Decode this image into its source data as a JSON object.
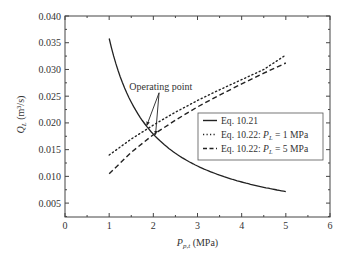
{
  "chart_data": {
    "type": "line",
    "title": "",
    "xlabel": "P_p,t (MPa)",
    "xlabel_main": "P",
    "xlabel_sub": "p,t",
    "xlabel_unit": " (MPa)",
    "ylabel": "Q_L (m3/s)",
    "ylabel_main": "Q",
    "ylabel_sub": "L",
    "ylabel_unit": " (m³/s)",
    "xlim": [
      0,
      6
    ],
    "ylim": [
      0.0024,
      0.04
    ],
    "xticks": [
      "0",
      "1",
      "2",
      "3",
      "4",
      "5",
      "6"
    ],
    "yticks": [
      "0.005",
      "0.010",
      "0.015",
      "0.020",
      "0.025",
      "0.030",
      "0.035",
      "0.040"
    ],
    "grid": false,
    "legend_position": "lower right (inside)",
    "series": [
      {
        "name": "Eq. 10.21",
        "style": "solid",
        "x": [
          1.0,
          1.25,
          1.5,
          1.75,
          2.0,
          2.5,
          3.0,
          3.5,
          4.0,
          4.5,
          5.0
        ],
        "y": [
          0.0358,
          0.0287,
          0.0239,
          0.0205,
          0.0179,
          0.0143,
          0.0119,
          0.0102,
          0.009,
          0.008,
          0.0072
        ]
      },
      {
        "name": "Eq. 10.22: P_L = 1 MPa",
        "style": "dotted",
        "x": [
          1.0,
          1.5,
          2.0,
          2.5,
          3.0,
          3.5,
          4.0,
          4.5,
          5.0
        ],
        "y": [
          0.014,
          0.017,
          0.0196,
          0.022,
          0.0242,
          0.0262,
          0.0281,
          0.03,
          0.0327
        ]
      },
      {
        "name": "Eq. 10.22: P_L = 5 MPa",
        "style": "dashed",
        "x": [
          1.0,
          1.5,
          2.0,
          2.5,
          3.0,
          3.5,
          4.0,
          4.5,
          5.0
        ],
        "y": [
          0.0105,
          0.0145,
          0.0178,
          0.0205,
          0.023,
          0.0252,
          0.0273,
          0.0293,
          0.0312
        ]
      }
    ],
    "annotations": [
      {
        "text": "Operating point",
        "points": [
          [
            1.85,
            0.0195
          ],
          [
            2.05,
            0.0178
          ]
        ]
      }
    ]
  },
  "legend": {
    "items": [
      {
        "label_pre": "Eq. 10.21",
        "label_var": "",
        "label_sub": "",
        "label_post": ""
      },
      {
        "label_pre": "Eq. 10.22: ",
        "label_var": "P",
        "label_sub": "L",
        "label_post": " = 1 MPa"
      },
      {
        "label_pre": "Eq. 10.22: ",
        "label_var": "P",
        "label_sub": "L",
        "label_post": " = 5 MPa"
      }
    ]
  },
  "annotation_label": "Operating point"
}
